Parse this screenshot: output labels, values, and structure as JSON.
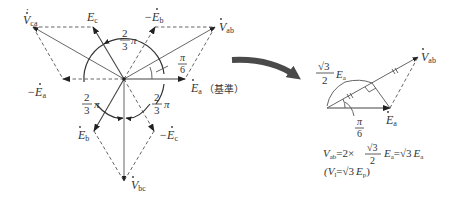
{
  "left_diagram": {
    "labels": {
      "Vca": "V",
      "Vca_sub": "ca",
      "Ec": "E",
      "Ec_sub": "c",
      "minus_Eb": "−E",
      "minus_Eb_sub": "b",
      "Vab": "V",
      "Vab_sub": "ab",
      "Ea": "E",
      "Ea_sub": "a",
      "reference": "（基準）",
      "minus_Ea": "−E",
      "minus_Ea_sub": "a",
      "Eb": "E",
      "Eb_sub": "b",
      "minus_Ec": "−E",
      "minus_Ec_sub": "c",
      "Vbc": "V",
      "Vbc_sub": "bc"
    },
    "angles": {
      "two_thirds_num": "2",
      "two_thirds_den": "3",
      "pi": "π",
      "pi_over_6_num": "π",
      "pi_over_6_den": "6"
    }
  },
  "right_diagram": {
    "labels": {
      "Vab": "V",
      "Vab_sub": "ab",
      "Ea": "E",
      "Ea_sub": "a",
      "half_sqrt3_num": "√3",
      "half_sqrt3_den": "2",
      "half_sqrt3_E": "E",
      "half_sqrt3_E_sub": "a",
      "angle_num": "π",
      "angle_den": "6"
    },
    "formula": {
      "line1_lhs": "V",
      "line1_lhs_sub": "ab",
      "line1_eq": "=2×",
      "line1_frac_num": "√3",
      "line1_frac_den": "2",
      "line1_E": "E",
      "line1_E_sub": "a",
      "line1_eq2": "=√3",
      "line1_E2": "E",
      "line1_E2_sub": "a",
      "line2_open": "(V",
      "line2_l_sub": "l",
      "line2_eq": "=√3",
      "line2_E": "E",
      "line2_p_sub": "p",
      "line2_close": ")"
    }
  },
  "colors": {
    "ink": "#333333",
    "arrow": "#4a4a4a"
  }
}
